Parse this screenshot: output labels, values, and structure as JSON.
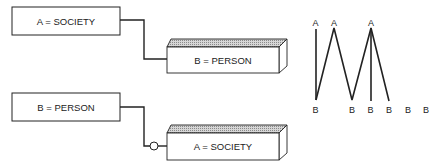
{
  "diagram": {
    "top_panel": {
      "source_box": {
        "label": "A = SOCIETY",
        "style": "flat"
      },
      "target_box": {
        "label": "B = PERSON",
        "style": "3d"
      },
      "connector": {
        "marker": "none"
      }
    },
    "bottom_panel": {
      "source_box": {
        "label": "B = PERSON",
        "style": "flat"
      },
      "target_box": {
        "label": "A = SOCIETY",
        "style": "3d"
      },
      "connector": {
        "marker": "circle"
      }
    },
    "zigzag": {
      "top_labels": [
        "A",
        "A",
        "A"
      ],
      "bottom_labels": [
        "B",
        "B",
        "B",
        "B",
        "B",
        "B"
      ]
    }
  },
  "colors": {
    "stroke": "#222222",
    "background": "#ffffff",
    "hatch": "#9a9a9a"
  }
}
